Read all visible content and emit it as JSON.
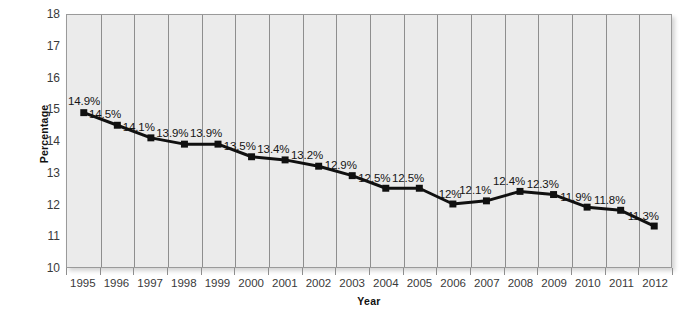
{
  "chart_data": {
    "type": "line",
    "title": "",
    "xlabel": "Year",
    "ylabel": "Percentage",
    "ylim": [
      10,
      18
    ],
    "y_ticks": [
      "10",
      "11",
      "12",
      "13",
      "14",
      "15",
      "16",
      "17",
      "18"
    ],
    "grid": "vertical",
    "legend": "none",
    "marker": "square",
    "series_color": "#101010",
    "plot_background": "#ebebeb",
    "gridline_color": "#8e8e8e",
    "categories": [
      "1995",
      "1996",
      "1997",
      "1998",
      "1999",
      "2000",
      "2001",
      "2002",
      "2003",
      "2004",
      "2005",
      "2006",
      "2007",
      "2008",
      "2009",
      "2010",
      "2011",
      "2012"
    ],
    "values": [
      14.9,
      14.5,
      14.1,
      13.9,
      13.9,
      13.5,
      13.4,
      13.2,
      12.9,
      12.5,
      12.5,
      12.0,
      12.1,
      12.4,
      12.3,
      11.9,
      11.8,
      11.3
    ],
    "data_labels": [
      "14.9%",
      "14.5%",
      "14.1%",
      "13.9%",
      "13.9%",
      "13.5%",
      "13.4%",
      "13.2%",
      "12.9%",
      "12.5%",
      "12.5%",
      "12%",
      "12.1%",
      "12.4%",
      "12.3%",
      "11.9%",
      "11.8%",
      "11.3%"
    ]
  }
}
